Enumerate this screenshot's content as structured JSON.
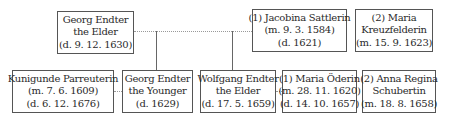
{
  "diagram": {
    "type": "family-tree",
    "persons": [
      {
        "id": "georg-elder",
        "lines": [
          "Georg Endter",
          "the Elder",
          "(d. 9. 12. 1630)"
        ]
      },
      {
        "id": "jacobina",
        "lines": [
          "(1) Jacobina Sattlerin",
          "(m. 9. 3. 1584)",
          "(d. 1621)"
        ]
      },
      {
        "id": "maria-kreuzfelderin",
        "lines": [
          "(2) Maria",
          "Kreuzfelderin",
          "(m. 15. 9. 1623)"
        ]
      },
      {
        "id": "kunigunde",
        "lines": [
          "Kunigunde Parreuterin",
          "(m. 7. 6. 1609)",
          "(d. 6. 12. 1676)"
        ]
      },
      {
        "id": "georg-younger",
        "lines": [
          "Georg Endter",
          "the Younger",
          "(d. 1629)"
        ]
      },
      {
        "id": "wolfgang-elder",
        "lines": [
          "Wolfgang Endter",
          "the Elder",
          "(d. 17. 5. 1659)"
        ]
      },
      {
        "id": "maria-oderin",
        "lines": [
          "(1) Maria Öderin",
          "(m. 28. 11. 1620)",
          "(d. 14. 10. 1657)"
        ]
      },
      {
        "id": "anna-regina",
        "lines": [
          "(2) Anna Regina",
          "Schubertin",
          "(m. 18. 8. 1658)"
        ]
      }
    ],
    "relations": [
      {
        "type": "marriage",
        "from": "georg-elder",
        "to": "jacobina"
      },
      {
        "type": "child",
        "parent": "georg-elder",
        "child": "georg-younger"
      },
      {
        "type": "child",
        "parent": "georg-elder",
        "child": "wolfgang-elder"
      },
      {
        "type": "marriage",
        "from": "kunigunde",
        "to": "georg-younger"
      },
      {
        "type": "marriage",
        "from": "wolfgang-elder",
        "to": "maria-oderin"
      }
    ]
  }
}
